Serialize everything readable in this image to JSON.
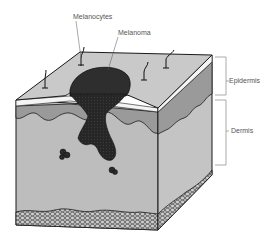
{
  "diagram": {
    "labels": {
      "melanocytes": "Melanocytes",
      "melanoma": "Melanoma",
      "epidermis": "Epidermis",
      "dermis": "Dermis"
    },
    "colors": {
      "top_surface": "#c9c9c9",
      "stratum_band": "#f4f4f4",
      "basal_layer": "#9a9a9a",
      "dermis": "#bdbdbd",
      "dermis_side": "#c4c4c4",
      "melanoma": "#2e2e2e",
      "outline": "#1a1a1a",
      "label_text": "#555555",
      "bracket": "#888888"
    }
  }
}
